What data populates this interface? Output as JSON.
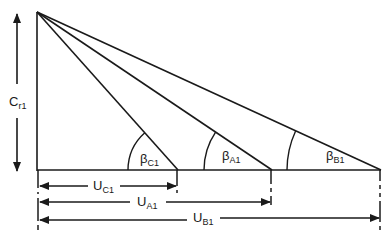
{
  "diagram": {
    "type": "velocity-triangles",
    "stroke_color": "#1a1a1a",
    "background": "#ffffff",
    "vertical_component": {
      "symbol": "C",
      "subscript": "r1"
    },
    "angles": [
      {
        "symbol": "β",
        "subscript": "C1"
      },
      {
        "symbol": "β",
        "subscript": "A1"
      },
      {
        "symbol": "β",
        "subscript": "B1"
      }
    ],
    "blade_speeds": [
      {
        "symbol": "U",
        "subscript": "C1"
      },
      {
        "symbol": "U",
        "subscript": "A1"
      },
      {
        "symbol": "U",
        "subscript": "B1"
      }
    ]
  }
}
